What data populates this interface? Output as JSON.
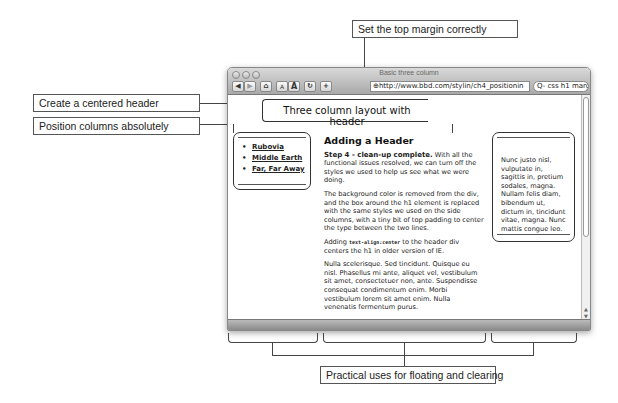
{
  "callouts": {
    "top_margin": "Set the top margin correctly",
    "centered_header": "Create a centered header",
    "position_columns": "Position columns absolutely",
    "floating_clearing": "Practical uses for floating and clearing"
  },
  "browser": {
    "window_title": "Basic three column",
    "toolbar": {
      "back": "◀",
      "forward": "▶",
      "home": "⌂",
      "text_smaller": "A",
      "text_larger": "A",
      "reload": "↻",
      "add_bookmark": "+"
    },
    "url": "http://www.bbd.com/stylin/ch4_positionin",
    "search_value": "Q- css h1 margin m"
  },
  "page": {
    "header_title": "Three column layout with header",
    "nav_items": [
      {
        "label": "Rubovia"
      },
      {
        "label": "Middle Earth"
      },
      {
        "label": "Far, Far Away"
      }
    ],
    "main": {
      "heading": "Adding a Header",
      "p1_lead": "Step 4 - clean-up complete.",
      "p1_rest": " With all the functional issues resolved, we can turn off the styles we used to help us see what we were doing.",
      "p2": "The background color is removed from the div, and the box around the h1 element is replaced with the same styles we used on the side columns, with a tiny bit of top padding to center the type between the two lines.",
      "p3_pre": "Adding ",
      "p3_code": "text-align:center",
      "p3_post": " to the header div centers the h1 in older version of IE.",
      "p4": "Nulla scelerisque. Sed tincidunt. Quisque eu nisl. Phasellus mi ante, aliquet vel, vestibulum sit amet, consectetuer non, ante. Suspendisse consequat condimentum enim. Morbi vestibulum lorem sit amet enim. Nulla venenatis fermentum purus."
    },
    "right_column_text": "Nunc justo nisl, vulputate in, sagittis in, pretium sodales, magna. Nullam felis diam, bibendum ut, dictum in, tincidunt vitae, magna. Nunc mattis congue leo."
  }
}
